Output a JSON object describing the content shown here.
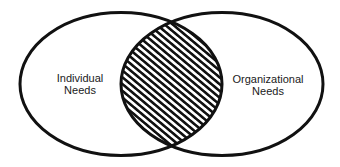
{
  "diagram": {
    "type": "venn",
    "sets": [
      {
        "id": "left",
        "label_line1": "Individual",
        "label_line2": "Needs"
      },
      {
        "id": "right",
        "label_line1": "Organizational",
        "label_line2": "Needs"
      }
    ],
    "intersection": {
      "fill": "diagonal-hatch",
      "label": ""
    },
    "colors": {
      "stroke": "#111111",
      "background": "#ffffff",
      "hatch": "#111111"
    }
  }
}
